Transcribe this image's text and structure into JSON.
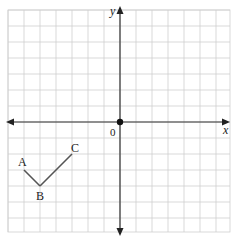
{
  "diagram": {
    "type": "coordinate-grid",
    "grid": {
      "x_min": -7,
      "x_max": 7,
      "y_min": -7,
      "y_max": 7,
      "cell_px": 16,
      "origin_px": [
        120,
        122
      ],
      "grid_color": "#cfcfcf",
      "axis_color": "#333333"
    },
    "axes": {
      "x_label": "x",
      "y_label": "y",
      "origin_label": "0"
    },
    "points": [
      {
        "label": "A",
        "x": -6,
        "y": -3
      },
      {
        "label": "B",
        "x": -5,
        "y": -4
      },
      {
        "label": "C",
        "x": -3,
        "y": -2
      }
    ],
    "segments": [
      [
        "A",
        "B"
      ],
      [
        "B",
        "C"
      ]
    ],
    "segment_color": "#555555"
  }
}
